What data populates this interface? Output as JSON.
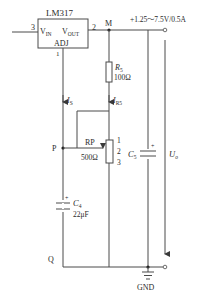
{
  "regulator": {
    "name": "LM317",
    "pin_in": "3",
    "pin_out": "2",
    "pin_adj": "1",
    "vin_label": "V",
    "vin_sub": "IN",
    "vout_label": "V",
    "vout_sub": "OUT",
    "adj_label": "ADJ"
  },
  "nodes": {
    "M": "M",
    "P": "P",
    "Q": "Q"
  },
  "output": {
    "spec": "+1.25～7.5V/0.5A",
    "uo_label": "U",
    "uo_sub": "o",
    "gnd": "GND"
  },
  "components": {
    "R5": {
      "name": "R",
      "sub": "5",
      "value": "100Ω"
    },
    "RP": {
      "name": "RP",
      "value": "500Ω",
      "pin1": "1",
      "pin2": "2",
      "pin3": "3"
    },
    "C4": {
      "name": "C",
      "sub": "4",
      "value": "22μF",
      "polarity": "+"
    },
    "C5": {
      "name": "C",
      "sub": "5",
      "polarity": "+"
    }
  },
  "currents": {
    "IS": {
      "name": "I",
      "sub": "S"
    },
    "IR5": {
      "name": "I",
      "sub": "R5"
    }
  },
  "colors": {
    "wire": "#4a4a4a",
    "text": "#2a2a2a",
    "background": "#ffffff"
  }
}
